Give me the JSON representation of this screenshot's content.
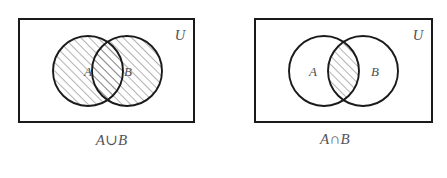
{
  "figure": {
    "background_color": "#ffffff",
    "stroke_color": "#1a1a1a",
    "hatch_color": "#6b6b70",
    "text_color": "#4e4e52"
  },
  "panels": [
    {
      "id": "union",
      "caption": "A∪B",
      "universe_label": "U",
      "set_a_label": "A",
      "set_b_label": "B",
      "shaded_region": "A ∪ B (both circles entirely shaded)",
      "rect": {
        "x": 19,
        "y": 19,
        "width": 175,
        "height": 103
      },
      "circle_a": {
        "cx": 88,
        "cy": 71,
        "r": 35
      },
      "circle_b": {
        "cx": 127,
        "cy": 71,
        "r": 35
      }
    },
    {
      "id": "intersection",
      "caption": "A∩B",
      "universe_label": "U",
      "set_a_label": "A",
      "set_b_label": "B",
      "shaded_region": "A ∩ B (lens-shaped overlap only)",
      "rect": {
        "x": 32,
        "y": 19,
        "width": 177,
        "height": 103
      },
      "circle_a": {
        "cx": 101,
        "cy": 71,
        "r": 35
      },
      "circle_b": {
        "cx": 140,
        "cy": 71,
        "r": 35
      }
    }
  ]
}
